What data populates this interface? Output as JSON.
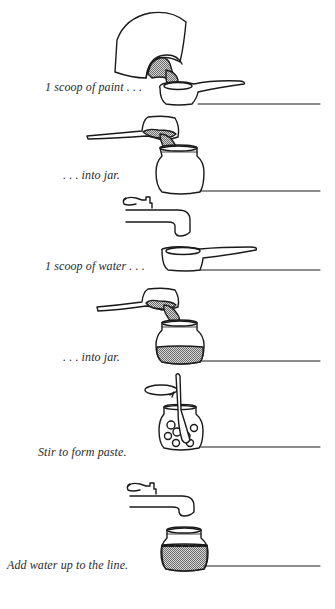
{
  "diagram": {
    "type": "instruction-sequence",
    "colors": {
      "ink": "#1a1a1a",
      "fill_shade": "#9a9a9a",
      "background": "#ffffff"
    },
    "steps": [
      {
        "id": 1,
        "caption": "1 scoop of paint . . .",
        "illustration": "paint-pot-pouring-into-scoop"
      },
      {
        "id": 2,
        "caption": ". . . into jar.",
        "illustration": "scoop-pouring-paint-into-empty-jar"
      },
      {
        "id": 3,
        "caption": "1 scoop of water . . .",
        "illustration": "faucet-above-empty-scoop"
      },
      {
        "id": 4,
        "caption": ". . . into jar.",
        "illustration": "scoop-pouring-into-jar-with-paint"
      },
      {
        "id": 5,
        "caption": "Stir to form paste.",
        "illustration": "spoon-stirring-jar"
      },
      {
        "id": 6,
        "caption": "Add water up to the line.",
        "illustration": "faucet-above-filled-jar"
      }
    ]
  }
}
